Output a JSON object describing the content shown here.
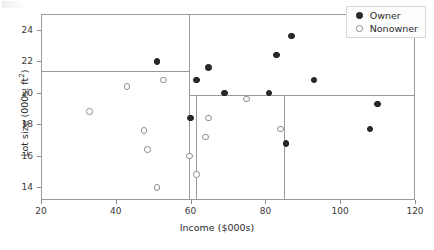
{
  "figure": {
    "background": "#ffffff",
    "owner_color": "#2b2b2b",
    "nonowner_color": "#8d8d8d",
    "split_line_color": "#9a9a9a"
  },
  "axes": {
    "xlabel": "Income ($000s)",
    "ylabel_text": "Lot size (000s. ft",
    "ylabel_sup": "2",
    "ylabel_tail": ")",
    "xlim": [
      20,
      120
    ],
    "ylim": [
      13.2,
      25.0
    ],
    "xticks": [
      20,
      40,
      60,
      80,
      100,
      120
    ],
    "xticklabels": [
      "20",
      "40",
      "60",
      "80",
      "100",
      "120"
    ],
    "yticks": [
      14,
      16,
      18,
      20,
      22,
      24
    ],
    "yticklabels": [
      "14",
      "16",
      "18",
      "20",
      "22",
      "24"
    ],
    "grid": false
  },
  "legend": {
    "position": "upper-right",
    "entries": [
      {
        "label": "Owner",
        "marker": "filled-circle"
      },
      {
        "label": "Nonowner",
        "marker": "open-circle"
      }
    ]
  },
  "splits": {
    "horizontal": [
      {
        "value": 21.4,
        "x_from": 20,
        "x_to": 59.7
      },
      {
        "value": 19.85,
        "x_from": 59.7,
        "x_to": 120
      }
    ],
    "vertical": [
      {
        "value": 59.7,
        "y_from": 13.2,
        "y_to": 25.0
      },
      {
        "value": 61.5,
        "y_from": 13.2,
        "y_to": 19.85
      },
      {
        "value": 85.0,
        "y_from": 13.2,
        "y_to": 19.85
      }
    ]
  },
  "chart_data": {
    "type": "scatter",
    "title": "",
    "xlabel": "Income ($000s)",
    "ylabel": "Lot size (000s. ft2)",
    "xlim": [
      20,
      120
    ],
    "ylim": [
      13.2,
      25.0
    ],
    "grid": false,
    "legend_position": "upper right",
    "series": [
      {
        "name": "Owner",
        "marker": "filled-circle",
        "color": "#2b2b2b",
        "points": [
          {
            "x": 51.0,
            "y": 22.0
          },
          {
            "x": 60.0,
            "y": 18.4
          },
          {
            "x": 61.5,
            "y": 20.8
          },
          {
            "x": 64.8,
            "y": 21.6
          },
          {
            "x": 69.0,
            "y": 20.0
          },
          {
            "x": 81.0,
            "y": 20.0
          },
          {
            "x": 83.0,
            "y": 22.4
          },
          {
            "x": 85.5,
            "y": 16.8
          },
          {
            "x": 87.0,
            "y": 23.6
          },
          {
            "x": 93.0,
            "y": 20.8
          },
          {
            "x": 108.0,
            "y": 17.7
          },
          {
            "x": 110.0,
            "y": 19.3
          }
        ]
      },
      {
        "name": "Nonowner",
        "marker": "open-circle",
        "color": "#8d8d8d",
        "points": [
          {
            "x": 33.0,
            "y": 18.8
          },
          {
            "x": 43.0,
            "y": 20.4
          },
          {
            "x": 47.5,
            "y": 17.6
          },
          {
            "x": 48.5,
            "y": 16.4
          },
          {
            "x": 51.0,
            "y": 14.0
          },
          {
            "x": 52.8,
            "y": 20.8
          },
          {
            "x": 59.7,
            "y": 16.0
          },
          {
            "x": 61.5,
            "y": 14.8
          },
          {
            "x": 64.8,
            "y": 18.4
          },
          {
            "x": 64.0,
            "y": 17.2
          },
          {
            "x": 75.0,
            "y": 19.6
          },
          {
            "x": 84.0,
            "y": 17.7
          }
        ]
      }
    ],
    "annotations": [
      {
        "kind": "split-line",
        "orientation": "horizontal",
        "value": 21.4
      },
      {
        "kind": "split-line",
        "orientation": "horizontal",
        "value": 19.85
      },
      {
        "kind": "split-line",
        "orientation": "vertical",
        "value": 59.7
      },
      {
        "kind": "split-line",
        "orientation": "vertical",
        "value": 61.5
      },
      {
        "kind": "split-line",
        "orientation": "vertical",
        "value": 85.0
      }
    ]
  }
}
